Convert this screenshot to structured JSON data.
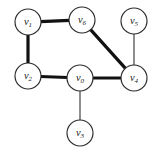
{
  "figure": {
    "background_color": "#ffffff",
    "width": 162,
    "height": 154
  },
  "graph": {
    "node_radius": 13,
    "node_fill": "#ffffff",
    "node_stroke": "#2b2b2b",
    "edge_thick_color": "#111111",
    "edge_thin_color": "#4a4a4a",
    "nodes": [
      {
        "id": "v0",
        "label_base": "v",
        "label_sub": "0",
        "label": "v0",
        "x": 80,
        "y": 78
      },
      {
        "id": "v1",
        "label_base": "v",
        "label_sub": "1",
        "label": "v1",
        "x": 28,
        "y": 22
      },
      {
        "id": "v2",
        "label_base": "v",
        "label_sub": "2",
        "label": "v2",
        "x": 28,
        "y": 76
      },
      {
        "id": "v3",
        "label_base": "v",
        "label_sub": "3",
        "label": "v3",
        "x": 80,
        "y": 133
      },
      {
        "id": "v4",
        "label_base": "v",
        "label_sub": "4",
        "label": "v4",
        "x": 134,
        "y": 78
      },
      {
        "id": "v5",
        "label_base": "v",
        "label_sub": "5",
        "label": "v5",
        "x": 134,
        "y": 21
      },
      {
        "id": "v6",
        "label_base": "v",
        "label_sub": "6",
        "label": "v6",
        "x": 82,
        "y": 20
      }
    ],
    "edges": [
      {
        "id": "e-v1-v6",
        "source": "v1",
        "target": "v6",
        "weight": "thick"
      },
      {
        "id": "e-v1-v2",
        "source": "v1",
        "target": "v2",
        "weight": "thick"
      },
      {
        "id": "e-v2-v0",
        "source": "v2",
        "target": "v0",
        "weight": "thick"
      },
      {
        "id": "e-v0-v4",
        "source": "v0",
        "target": "v4",
        "weight": "thick"
      },
      {
        "id": "e-v6-v4",
        "source": "v6",
        "target": "v4",
        "weight": "thick"
      },
      {
        "id": "e-v5-v4",
        "source": "v5",
        "target": "v4",
        "weight": "thin"
      },
      {
        "id": "e-v0-v3",
        "source": "v0",
        "target": "v3",
        "weight": "thin"
      }
    ]
  }
}
